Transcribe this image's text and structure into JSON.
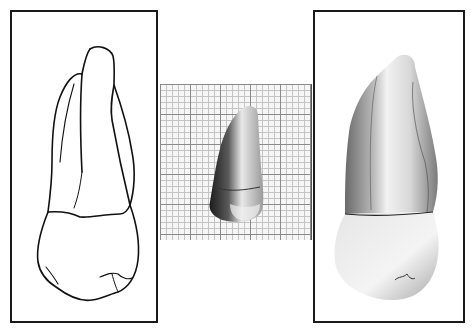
{
  "figure": {
    "panels": [
      {
        "id": "left",
        "label": "line-drawing",
        "description": "Outline drawing of maxillary canine, labial view"
      },
      {
        "id": "middle",
        "label": "photo-on-grid",
        "description": "Photograph of tooth on millimeter graph paper"
      },
      {
        "id": "right",
        "label": "photograph",
        "description": "Enlarged photograph of tooth, labial view"
      }
    ],
    "grid": {
      "major_spacing_px": 30,
      "minor_spacing_px": 6,
      "major_color": "#8a8a8a",
      "minor_color": "#c4c4c4"
    },
    "frame_color": "#1a1a1a"
  }
}
